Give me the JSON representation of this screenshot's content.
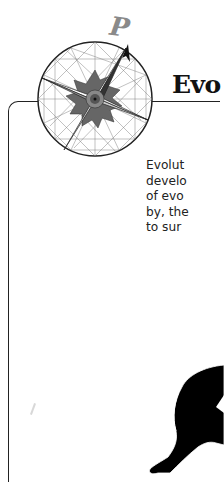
{
  "logo": {
    "letter": "P",
    "icon": "compass-rose-icon"
  },
  "heading": {
    "text": "Evo"
  },
  "body": {
    "lines": [
      "Evolut",
      "develo",
      "of evo",
      "by, the",
      "to sur"
    ]
  },
  "illustration": {
    "icon": "ape-silhouette-icon"
  },
  "colors": {
    "frame": "#222222",
    "heading": "#111111",
    "logo_letter": "#8a8a8a",
    "text": "#222222"
  }
}
